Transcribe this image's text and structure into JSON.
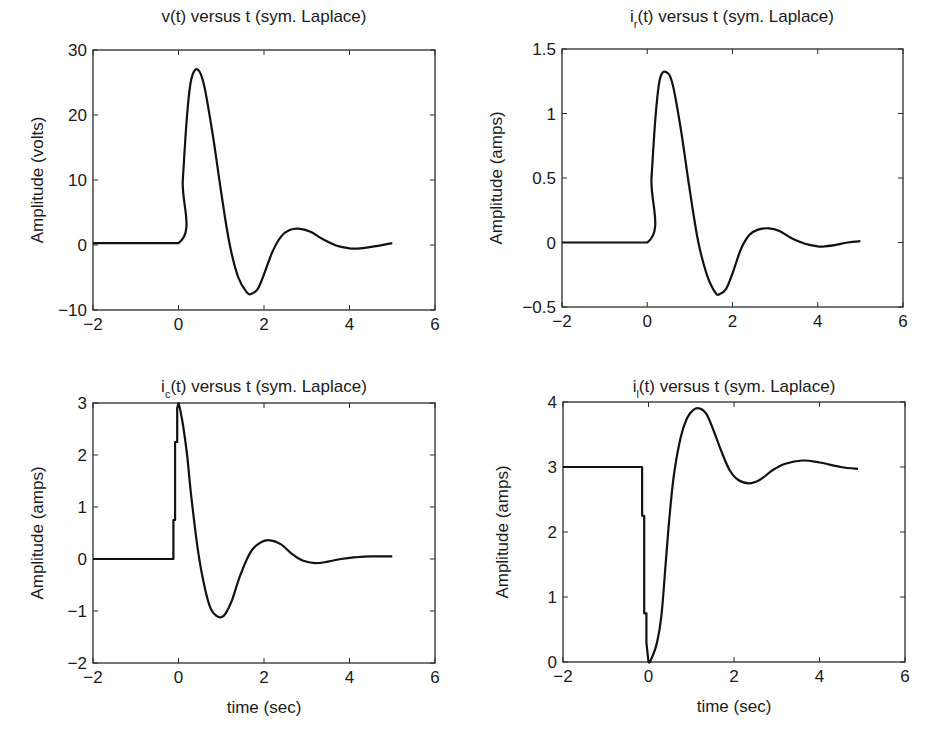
{
  "chart_data": [
    {
      "id": "v",
      "type": "line",
      "title": "v(t) versus t (sym. Laplace)",
      "title_parts": {
        "main": "v",
        "sub": "",
        "rest": "(t) versus t (sym. Laplace)"
      },
      "xlabel": "",
      "ylabel": "Amplitude (volts)",
      "xlim": [
        -2,
        6
      ],
      "ylim": [
        -10,
        30
      ],
      "xticks": [
        -2,
        0,
        2,
        4,
        6
      ],
      "yticks": [
        -10,
        0,
        10,
        20,
        30
      ],
      "xtick_labels": [
        "−2",
        "0",
        "2",
        "4",
        "6"
      ],
      "ytick_labels": [
        "−10",
        "0",
        "10",
        "20",
        "30"
      ],
      "grid": false,
      "box": {
        "x0": 93,
        "y0": 50,
        "x1": 435,
        "y1": 310
      },
      "x": [
        -2,
        0,
        0.1,
        0.2,
        0.3,
        0.45,
        0.6,
        0.8,
        1.0,
        1.2,
        1.4,
        1.6,
        1.7,
        1.85,
        2.0,
        2.2,
        2.4,
        2.6,
        2.85,
        3.1,
        3.4,
        3.7,
        4.0,
        4.15,
        4.4,
        4.7,
        5.0
      ],
      "values": [
        0.3,
        0.3,
        10,
        20,
        25.5,
        27,
        24.5,
        17,
        8,
        0,
        -5,
        -7.3,
        -7.5,
        -6.8,
        -4.5,
        -1,
        1.3,
        2.3,
        2.5,
        2,
        0.8,
        -0.1,
        -0.5,
        -0.55,
        -0.4,
        -0.1,
        0.3
      ]
    },
    {
      "id": "ir",
      "type": "line",
      "title": "i_r(t) versus t (sym. Laplace)",
      "title_parts": {
        "main": "i",
        "sub": "r",
        "rest": "(t) versus t (sym. Laplace)"
      },
      "xlabel": "",
      "ylabel": "Amplitude (amps)",
      "xlim": [
        -2,
        6
      ],
      "ylim": [
        -0.5,
        1.5
      ],
      "xticks": [
        -2,
        0,
        2,
        4,
        6
      ],
      "yticks": [
        -0.5,
        0,
        0.5,
        1,
        1.5
      ],
      "xtick_labels": [
        "−2",
        "0",
        "2",
        "4",
        "6"
      ],
      "ytick_labels": [
        "−0.5",
        "0",
        "0.5",
        "1",
        "1.5"
      ],
      "grid": false,
      "box": {
        "x0": 562,
        "y0": 49,
        "x1": 903,
        "y1": 307
      },
      "x": [
        -2,
        0,
        0.1,
        0.2,
        0.3,
        0.45,
        0.6,
        0.8,
        1.0,
        1.2,
        1.4,
        1.6,
        1.7,
        1.85,
        2.0,
        2.2,
        2.4,
        2.6,
        2.85,
        3.1,
        3.4,
        3.7,
        4.0,
        4.15,
        4.4,
        4.7,
        5.0
      ],
      "values": [
        0,
        0,
        0.5,
        1.0,
        1.27,
        1.32,
        1.22,
        0.85,
        0.4,
        0,
        -0.25,
        -0.39,
        -0.4,
        -0.36,
        -0.24,
        -0.05,
        0.06,
        0.1,
        0.11,
        0.09,
        0.03,
        -0.01,
        -0.03,
        -0.03,
        -0.02,
        0.0,
        0.01
      ]
    },
    {
      "id": "ic",
      "type": "line",
      "title": "i_c(t) versus t (sym. Laplace)",
      "title_parts": {
        "main": "i",
        "sub": "c",
        "rest": "(t) versus t (sym. Laplace)"
      },
      "xlabel": "time (sec)",
      "ylabel": "Amplitude (amps)",
      "xlim": [
        -2,
        6
      ],
      "ylim": [
        -2,
        3
      ],
      "xticks": [
        -2,
        0,
        2,
        4,
        6
      ],
      "yticks": [
        -2,
        -1,
        0,
        1,
        2,
        3
      ],
      "xtick_labels": [
        "−2",
        "0",
        "2",
        "4",
        "6"
      ],
      "ytick_labels": [
        "−2",
        "−1",
        "0",
        "1",
        "2",
        "3"
      ],
      "grid": false,
      "box": {
        "x0": 93,
        "y0": 403,
        "x1": 435,
        "y1": 663
      },
      "x": [
        -2,
        -0.12,
        -0.12,
        -0.08,
        -0.08,
        -0.03,
        -0.03,
        0,
        0.1,
        0.2,
        0.3,
        0.45,
        0.6,
        0.75,
        0.9,
        1.0,
        1.1,
        1.25,
        1.45,
        1.7,
        1.95,
        2.15,
        2.4,
        2.65,
        2.9,
        3.2,
        3.5,
        3.8,
        4.1,
        4.5,
        5.0
      ],
      "values": [
        0,
        0,
        0.75,
        0.75,
        2.25,
        2.25,
        2.9,
        3.0,
        2.6,
        2.0,
        1.2,
        0.2,
        -0.5,
        -0.95,
        -1.1,
        -1.12,
        -1.05,
        -0.8,
        -0.3,
        0.15,
        0.33,
        0.36,
        0.28,
        0.1,
        -0.03,
        -0.08,
        -0.05,
        0.0,
        0.03,
        0.05,
        0.05
      ]
    },
    {
      "id": "il",
      "type": "line",
      "title": "i_l(t) versus t (sym. Laplace)",
      "title_parts": {
        "main": "i",
        "sub": "l",
        "rest": "(t) versus t (sym. Laplace)"
      },
      "xlabel": "time (sec)",
      "ylabel": "Amplitude (amps)",
      "xlim": [
        -2,
        6
      ],
      "ylim": [
        0,
        4
      ],
      "xticks": [
        -2,
        0,
        2,
        4,
        6
      ],
      "yticks": [
        0,
        1,
        2,
        3,
        4
      ],
      "xtick_labels": [
        "−2",
        "0",
        "2",
        "4",
        "6"
      ],
      "ytick_labels": [
        "0",
        "1",
        "2",
        "3",
        "4"
      ],
      "grid": false,
      "box": {
        "x0": 563,
        "y0": 402,
        "x1": 905,
        "y1": 662
      },
      "x": [
        -2,
        -0.15,
        -0.15,
        -0.1,
        -0.1,
        -0.05,
        -0.05,
        0,
        0.1,
        0.2,
        0.3,
        0.4,
        0.5,
        0.6,
        0.75,
        0.9,
        1.05,
        1.2,
        1.35,
        1.5,
        1.7,
        1.9,
        2.1,
        2.35,
        2.6,
        2.9,
        3.2,
        3.6,
        4.0,
        4.5,
        4.9
      ],
      "values": [
        3,
        3,
        2.25,
        2.25,
        0.75,
        0.75,
        0.3,
        0,
        0.1,
        0.3,
        0.7,
        1.5,
        2.3,
        2.9,
        3.45,
        3.75,
        3.88,
        3.9,
        3.82,
        3.6,
        3.25,
        2.95,
        2.8,
        2.75,
        2.8,
        2.95,
        3.05,
        3.1,
        3.07,
        3.0,
        2.97
      ]
    }
  ]
}
